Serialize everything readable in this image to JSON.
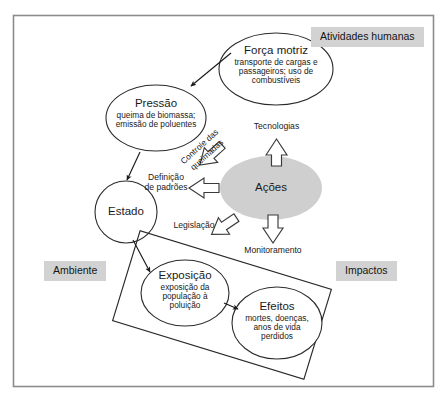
{
  "diagram": {
    "border_color": "#8c8c8c",
    "accent_gray": "#d2d2d2",
    "acoes_fill": "#cfcfcf",
    "zones": [
      {
        "key": "atividades",
        "label": "Atividades humanas"
      },
      {
        "key": "ambiente",
        "label": "Ambiente"
      },
      {
        "key": "impactos",
        "label": "Impactos"
      }
    ],
    "nodes": [
      {
        "key": "forca_motriz",
        "title": "Força motriz",
        "detail": "transporte de cargas e passageiros; uso de combustíveis",
        "detail_lines": [
          "transporte de cargas e",
          "passageiros; uso de",
          "combustíveis"
        ],
        "shape": "ellipse",
        "fill": "none"
      },
      {
        "key": "pressao",
        "title": "Pressão",
        "detail": "queima de biomassa; emissão de poluentes",
        "detail_lines": [
          "queima de biomassa;",
          "emissão de poluentes"
        ],
        "shape": "ellipse",
        "fill": "none"
      },
      {
        "key": "estado",
        "title": "Estado",
        "detail": "",
        "detail_lines": [],
        "shape": "circle",
        "fill": "none"
      },
      {
        "key": "acoes",
        "title": "Ações",
        "detail": "",
        "detail_lines": [],
        "shape": "ellipse",
        "fill": "#cfcfcf"
      },
      {
        "key": "exposicao",
        "title": "Exposição",
        "detail": "exposição da população à poluição",
        "detail_lines": [
          "exposição da",
          "população à",
          "poluição"
        ],
        "shape": "ellipse",
        "fill": "none"
      },
      {
        "key": "efeitos",
        "title": "Efeitos",
        "detail": "mortes, doenças, anos de vida perdidos",
        "detail_lines": [
          "mortes, doenças,",
          "anos de vida",
          "perdidos"
        ],
        "shape": "ellipse",
        "fill": "none"
      }
    ],
    "flow_labels": [
      {
        "key": "controle_queimadas",
        "text_line1": "Controle das",
        "text_line2": "queimadas",
        "rotated": true
      },
      {
        "key": "definicao_padroes",
        "text_line1": "Definição",
        "text_line2": "de padrões",
        "rotated": false
      },
      {
        "key": "legislacao",
        "text_line1": "Legislação",
        "text_line2": "",
        "rotated": false
      },
      {
        "key": "tecnologias",
        "text_line1": "Tecnologias",
        "text_line2": "",
        "rotated": false
      },
      {
        "key": "monitoramento",
        "text_line1": "Monitoramento",
        "text_line2": "",
        "rotated": false
      }
    ]
  }
}
